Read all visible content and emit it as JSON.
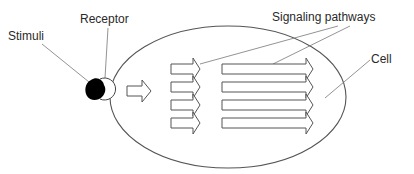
{
  "labels": {
    "stimuli": "Stimuli",
    "receptor": "Receptor",
    "signaling_pathways": "Signaling pathways",
    "cell": "Cell"
  },
  "colors": {
    "stroke": "#555555",
    "stimulus_fill": "#000000",
    "background": "#ffffff",
    "text": "#2a2a2a"
  },
  "structure": {
    "entry_arrow_count": 1,
    "short_pathway_arrows": 4,
    "long_pathway_arrows": 4
  }
}
